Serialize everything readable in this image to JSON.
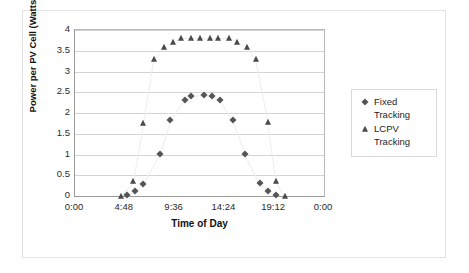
{
  "chart_data": {
    "type": "scatter",
    "title": "",
    "xlabel": "Time of Day",
    "ylabel": "Power per PV Cell (Watts)",
    "xlim": [
      0,
      1440
    ],
    "ylim": [
      0,
      4
    ],
    "xticks": [
      "0:00",
      "4:48",
      "9:36",
      "14:24",
      "19:12",
      "0:00"
    ],
    "xtick_values": [
      0,
      288,
      576,
      864,
      1152,
      1440
    ],
    "yticks": [
      "0",
      "0.5",
      "1",
      "1.5",
      "2",
      "2.5",
      "3",
      "3.5",
      "4"
    ],
    "ytick_values": [
      0,
      0.5,
      1,
      1.5,
      2,
      2.5,
      3,
      3.5,
      4
    ],
    "grid": "horizontal",
    "legend_position": "right",
    "series": [
      {
        "name": "Fixed Tracking",
        "marker": "diamond",
        "color": "#555555",
        "points": [
          {
            "x": 300,
            "y": 0.02
          },
          {
            "x": 348,
            "y": 0.11
          },
          {
            "x": 396,
            "y": 0.3
          },
          {
            "x": 492,
            "y": 1.01
          },
          {
            "x": 552,
            "y": 1.82
          },
          {
            "x": 636,
            "y": 2.31
          },
          {
            "x": 672,
            "y": 2.41
          },
          {
            "x": 744,
            "y": 2.44
          },
          {
            "x": 792,
            "y": 2.41
          },
          {
            "x": 840,
            "y": 2.31
          },
          {
            "x": 912,
            "y": 1.82
          },
          {
            "x": 984,
            "y": 1.01
          },
          {
            "x": 1068,
            "y": 0.31
          },
          {
            "x": 1116,
            "y": 0.12
          },
          {
            "x": 1164,
            "y": 0.03
          }
        ]
      },
      {
        "name": "LCPV Tracking",
        "marker": "triangle",
        "color": "#4a4a4a",
        "points": [
          {
            "x": 264,
            "y": 0.01
          },
          {
            "x": 336,
            "y": 0.35
          },
          {
            "x": 396,
            "y": 1.76
          },
          {
            "x": 456,
            "y": 3.3
          },
          {
            "x": 516,
            "y": 3.6
          },
          {
            "x": 564,
            "y": 3.7
          },
          {
            "x": 612,
            "y": 3.8
          },
          {
            "x": 672,
            "y": 3.8
          },
          {
            "x": 720,
            "y": 3.8
          },
          {
            "x": 780,
            "y": 3.8
          },
          {
            "x": 828,
            "y": 3.8
          },
          {
            "x": 888,
            "y": 3.8
          },
          {
            "x": 936,
            "y": 3.72
          },
          {
            "x": 996,
            "y": 3.6
          },
          {
            "x": 1044,
            "y": 3.3
          },
          {
            "x": 1116,
            "y": 1.78
          },
          {
            "x": 1164,
            "y": 0.37
          },
          {
            "x": 1212,
            "y": 0.01
          }
        ]
      }
    ]
  },
  "legend": {
    "items": [
      {
        "label": "Fixed\nTracking",
        "marker": "diamond"
      },
      {
        "label": "LCPV Tracking",
        "marker": "triangle"
      }
    ]
  }
}
